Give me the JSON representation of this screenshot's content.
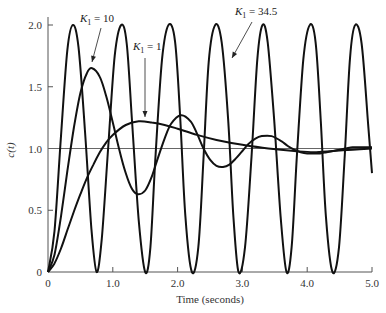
{
  "chart_data": {
    "type": "line",
    "title": "",
    "xlabel": "Time (seconds)",
    "ylabel": "c(t)",
    "xlim": [
      0,
      5.0
    ],
    "ylim": [
      0,
      2.0
    ],
    "grid": false,
    "legend": "none (curves labeled by annotations)",
    "x_ticks": [
      0,
      1.0,
      2.0,
      3.0,
      4.0,
      5.0
    ],
    "x_tick_labels": [
      "0",
      "1.0",
      "2.0",
      "3.0",
      "4.0",
      "5.0"
    ],
    "y_ticks": [
      0,
      0.5,
      1.0,
      1.5,
      2.0
    ],
    "y_tick_labels": [
      "0",
      "0.5",
      "1.0",
      "1.5",
      "2.0"
    ],
    "reference_line": {
      "y": 1.0,
      "label": ""
    },
    "series": [
      {
        "name": "K1 = 34.5",
        "description": "Sustained oscillation between 0 and 2.0, period ≈ 0.745 s",
        "t": [
          0,
          0.1,
          0.2,
          0.3,
          0.385,
          0.47,
          0.57,
          0.67,
          0.75,
          0.83,
          0.93,
          1.03,
          1.13,
          1.215,
          1.3,
          1.4,
          1.5,
          1.58,
          1.66,
          1.76,
          1.86,
          1.96,
          2.04,
          2.12,
          2.22,
          2.32,
          2.4,
          2.48,
          2.58,
          2.68,
          2.78,
          2.86,
          2.94,
          3.04,
          3.14,
          3.23,
          3.31,
          3.39,
          3.49,
          3.59,
          3.68,
          3.76,
          3.84,
          3.94,
          4.04,
          4.13,
          4.21,
          4.29,
          4.39,
          4.49,
          4.58,
          4.66,
          4.74,
          4.84,
          4.94,
          5.0
        ],
        "values": [
          0,
          0.33,
          1.1,
          1.8,
          2.0,
          1.82,
          1.15,
          0.35,
          0.0,
          0.27,
          1.02,
          1.75,
          2.0,
          1.85,
          1.2,
          0.42,
          0.0,
          0.2,
          0.95,
          1.72,
          2.0,
          1.87,
          1.25,
          0.45,
          0.0,
          0.2,
          0.92,
          1.7,
          2.0,
          1.86,
          1.24,
          0.46,
          0.0,
          0.2,
          0.93,
          1.72,
          2.0,
          1.86,
          1.23,
          0.45,
          0.0,
          0.2,
          0.93,
          1.72,
          2.0,
          1.86,
          1.22,
          0.44,
          0.0,
          0.2,
          0.95,
          1.73,
          2.0,
          1.85,
          1.2,
          0.8
        ]
      },
      {
        "name": "K1 = 10",
        "description": "Underdamped response, overshoot ≈ 1.65 at t ≈ 0.68 s",
        "t": [
          0,
          0.1,
          0.2,
          0.3,
          0.4,
          0.5,
          0.6,
          0.68,
          0.8,
          0.9,
          1.0,
          1.1,
          1.2,
          1.3,
          1.39,
          1.5,
          1.6,
          1.7,
          1.8,
          1.9,
          2.05,
          2.2,
          2.3,
          2.4,
          2.5,
          2.6,
          2.7,
          2.8,
          2.9,
          3.0,
          3.1,
          3.2,
          3.3,
          3.45,
          3.6,
          3.7,
          3.8,
          3.9,
          4.0,
          4.1,
          4.2,
          4.3,
          4.4,
          4.5,
          4.6,
          4.7,
          4.8,
          4.9,
          5.0
        ],
        "values": [
          0,
          0.14,
          0.45,
          0.82,
          1.17,
          1.45,
          1.61,
          1.65,
          1.58,
          1.42,
          1.21,
          0.99,
          0.8,
          0.67,
          0.63,
          0.66,
          0.77,
          0.93,
          1.08,
          1.2,
          1.27,
          1.22,
          1.12,
          1.0,
          0.91,
          0.86,
          0.85,
          0.87,
          0.92,
          0.98,
          1.04,
          1.08,
          1.1,
          1.1,
          1.06,
          1.02,
          0.99,
          0.97,
          0.96,
          0.96,
          0.96,
          0.97,
          0.98,
          0.99,
          1.0,
          1.01,
          1.01,
          1.01,
          1.01
        ]
      },
      {
        "name": "K1 = 1",
        "description": "Sluggish response, maximum ≈ 1.22 at t ≈ 1.4 s",
        "t": [
          0,
          0.1,
          0.2,
          0.3,
          0.4,
          0.5,
          0.6,
          0.7,
          0.8,
          0.9,
          1.0,
          1.2,
          1.4,
          1.6,
          1.8,
          2.0,
          2.3,
          2.6,
          3.0,
          3.4,
          3.8,
          4.1,
          4.4,
          4.7,
          5.0
        ],
        "values": [
          0,
          0.07,
          0.19,
          0.34,
          0.49,
          0.63,
          0.76,
          0.87,
          0.97,
          1.05,
          1.11,
          1.19,
          1.22,
          1.21,
          1.19,
          1.16,
          1.11,
          1.07,
          1.03,
          1.0,
          0.98,
          0.97,
          0.98,
          0.99,
          1.0
        ]
      }
    ],
    "annotations": [
      {
        "text_main": "K",
        "text_sub": "1",
        "text_rest": " = 10",
        "label_xy_px": [
          80,
          22
        ],
        "arrow_to_px": [
          92,
          62
        ],
        "arrow_from_px": [
          101,
          28
        ]
      },
      {
        "text_main": "K",
        "text_sub": "1",
        "text_rest": " = 1",
        "label_xy_px": [
          133,
          50
        ],
        "arrow_to_px": [
          145,
          117
        ],
        "arrow_from_px": [
          145,
          58
        ]
      },
      {
        "text_main": "K",
        "text_sub": "1",
        "text_rest": " = 34.5",
        "label_xy_px": [
          235,
          15
        ],
        "arrow_to_px": [
          232,
          58
        ],
        "arrow_from_px": [
          252,
          22
        ]
      }
    ]
  }
}
